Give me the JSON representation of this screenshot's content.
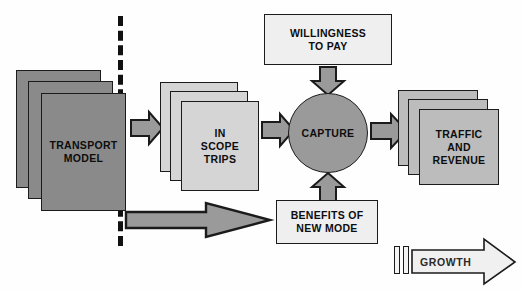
{
  "diagram": {
    "background_color": "#fefefe",
    "outline_color": "#1b1b1b",
    "colors": {
      "dark_gray": "#8a8a8a",
      "light_gray": "#d5d5d5",
      "medium_gray": "#bcbcbc",
      "pale_gray": "#efefef",
      "arrow_gray": "#9a9a9a",
      "growth_fill": "#f0f0f0",
      "divider": "#111111"
    },
    "nodes": {
      "transport_model": {
        "label_line1": "TRANSPORT",
        "label_line2": "MODEL",
        "shape": "stacked-cards",
        "stack_count": 3,
        "fill": "#8a8a8a"
      },
      "in_scope_trips": {
        "label_line1": "IN",
        "label_line2": "SCOPE",
        "label_line3": "TRIPS",
        "shape": "stacked-cards",
        "stack_count": 3,
        "fill": "#d5d5d5"
      },
      "willingness_to_pay": {
        "label_line1": "WILLINGNESS",
        "label_line2": "TO PAY",
        "shape": "rectangle",
        "fill": "#efefef"
      },
      "capture": {
        "label": "CAPTURE",
        "shape": "circle",
        "fill": "#9a9a9a"
      },
      "benefits_of_new_mode": {
        "label_line1": "BENEFITS OF",
        "label_line2": "NEW MODE",
        "shape": "rectangle",
        "fill": "#efefef"
      },
      "traffic_and_revenue": {
        "label_line1": "TRAFFIC",
        "label_line2": "AND",
        "label_line3": "REVENUE",
        "shape": "stacked-cards",
        "stack_count": 3,
        "fill": "#bcbcbc"
      },
      "growth": {
        "label": "GROWTH",
        "shape": "block-arrow",
        "fill": "#f0f0f0"
      }
    },
    "connectors": [
      {
        "name": "transport-to-inscope",
        "from": "transport_model",
        "to": "in_scope_trips",
        "direction": "right"
      },
      {
        "name": "inscope-to-capture",
        "from": "in_scope_trips",
        "to": "capture",
        "direction": "right"
      },
      {
        "name": "willingness-to-capture",
        "from": "willingness_to_pay",
        "to": "capture",
        "direction": "down"
      },
      {
        "name": "benefits-to-capture",
        "from": "benefits_of_new_mode",
        "to": "capture",
        "direction": "up"
      },
      {
        "name": "capture-to-traffic",
        "from": "capture",
        "to": "traffic_and_revenue",
        "direction": "right"
      },
      {
        "name": "model-to-benefits",
        "from": "transport_model",
        "to": "benefits_of_new_mode",
        "direction": "right"
      }
    ]
  }
}
